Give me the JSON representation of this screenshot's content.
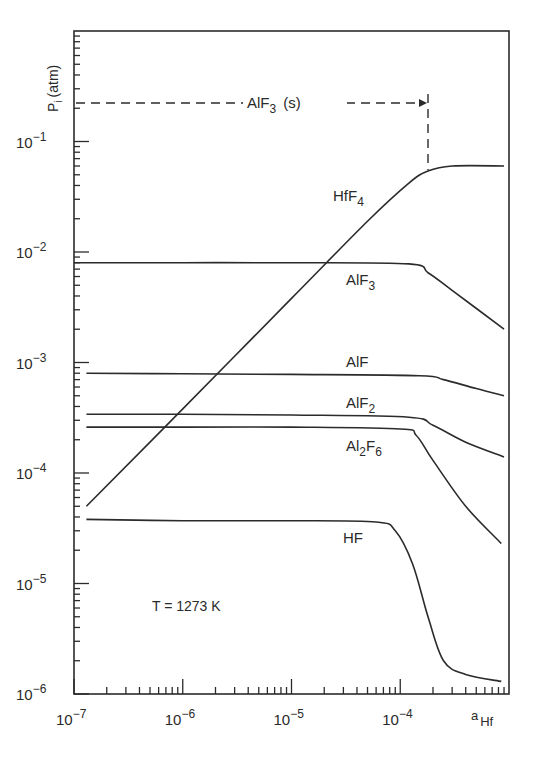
{
  "chart_data": {
    "type": "line",
    "title": "",
    "xlabel": "a_Hf",
    "ylabel": "P_i (atm)",
    "xscale": "log",
    "yscale": "log",
    "xlim": [
      1e-07,
      0.001
    ],
    "ylim": [
      1e-06,
      1.0
    ],
    "x_tick_labels": [
      "10^-7",
      "10^-6",
      "10^-5",
      "10^-4"
    ],
    "y_tick_labels": [
      "10^-1",
      "10^-2",
      "10^-3",
      "10^-4",
      "10^-5",
      "10^-6"
    ],
    "grid": false,
    "annotations": [
      {
        "text": "AlF3 (s)",
        "type": "dashed-arrow",
        "from_x": 1e-07,
        "to_x": 0.00018,
        "y": 0.22,
        "note": "dashed vertical drop at a_Hf ≈ 1.8e-4"
      },
      {
        "text": "T = 1273 K"
      }
    ],
    "series": [
      {
        "name": "HfF4",
        "x": [
          1.3e-07,
          1e-06,
          1e-05,
          5e-05,
          0.00012,
          0.00018,
          0.0003,
          0.0009
        ],
        "y": [
          5e-05,
          0.00038,
          0.0038,
          0.019,
          0.042,
          0.054,
          0.06,
          0.06
        ]
      },
      {
        "name": "AlF3",
        "x": [
          1e-07,
          1e-06,
          1e-05,
          0.00012,
          0.00018,
          0.0003,
          0.0009
        ],
        "y": [
          0.008,
          0.008,
          0.008,
          0.0078,
          0.0065,
          0.0045,
          0.002
        ]
      },
      {
        "name": "AlF",
        "x": [
          1.3e-07,
          1e-06,
          1e-05,
          0.00015,
          0.00025,
          0.0005,
          0.0009
        ],
        "y": [
          0.0008,
          0.00079,
          0.00078,
          0.00076,
          0.0007,
          0.00058,
          0.0005
        ]
      },
      {
        "name": "AlF2",
        "x": [
          1.3e-07,
          1e-06,
          1e-05,
          0.00012,
          0.0002,
          0.0004,
          0.0009
        ],
        "y": [
          0.00034,
          0.00034,
          0.000335,
          0.00032,
          0.00027,
          0.00019,
          0.00014
        ]
      },
      {
        "name": "Al2F6",
        "x": [
          1.3e-07,
          1e-06,
          1e-05,
          0.0001,
          0.00014,
          0.0002,
          0.0004,
          0.00085
        ],
        "y": [
          0.00026,
          0.00026,
          0.00026,
          0.00025,
          0.00022,
          0.00013,
          5e-05,
          2.3e-05
        ]
      },
      {
        "name": "HF",
        "x": [
          1.3e-07,
          1e-06,
          1e-05,
          6e-05,
          9e-05,
          0.00013,
          0.00018,
          0.00025,
          0.0004,
          0.00085
        ],
        "y": [
          3.8e-05,
          3.7e-05,
          3.7e-05,
          3.6e-05,
          3e-05,
          1.5e-05,
          5e-06,
          2e-06,
          1.5e-06,
          1.3e-06
        ]
      }
    ]
  },
  "labels": {
    "ylabel_main": "P",
    "ylabel_sub": "i",
    "ylabel_unit": "(atm)",
    "xlabel_main": "a",
    "xlabel_sub": "Hf",
    "temperature": "T = 1273 K",
    "solid_phase_main": "AlF",
    "solid_phase_sub": "3",
    "solid_phase_suffix": "(s)"
  },
  "series_labels": [
    {
      "main": "HfF",
      "sub": "4",
      "x": 333,
      "y": 201
    },
    {
      "main": "AlF",
      "sub": "3",
      "x": 346,
      "y": 285
    },
    {
      "main": "AlF",
      "sub": "",
      "x": 346,
      "y": 367
    },
    {
      "main": "AlF",
      "sub": "2",
      "x": 346,
      "y": 408
    },
    {
      "main": "Al",
      "sub": "2",
      "main2": "F",
      "sub2": "6",
      "x": 346,
      "y": 451
    },
    {
      "main": "HF",
      "sub": "",
      "x": 343,
      "y": 543
    }
  ],
  "axes": {
    "x_ticks": [
      {
        "base": "10",
        "exp": "−7"
      },
      {
        "base": "10",
        "exp": "−6"
      },
      {
        "base": "10",
        "exp": "−5"
      },
      {
        "base": "10",
        "exp": "−4"
      }
    ],
    "y_ticks": [
      {
        "base": "10",
        "exp": "−1"
      },
      {
        "base": "10",
        "exp": "−2"
      },
      {
        "base": "10",
        "exp": "−3"
      },
      {
        "base": "10",
        "exp": "−4"
      },
      {
        "base": "10",
        "exp": "−5"
      },
      {
        "base": "10",
        "exp": "−6"
      }
    ]
  }
}
